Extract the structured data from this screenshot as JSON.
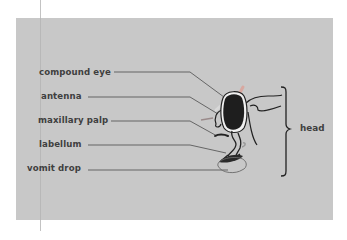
{
  "diagram": {
    "background_color": "#ffffff",
    "panel_color": "#c8c8c8",
    "line_color": "#555555",
    "labels": [
      {
        "id": "compound-eye",
        "text": "compound eye"
      },
      {
        "id": "antenna",
        "text": "antenna"
      },
      {
        "id": "maxillary-palp",
        "text": "maxillary palp"
      },
      {
        "id": "labellum",
        "text": "labellum"
      },
      {
        "id": "vomit-drop",
        "text": "vomit drop"
      }
    ],
    "group_label": "head"
  }
}
